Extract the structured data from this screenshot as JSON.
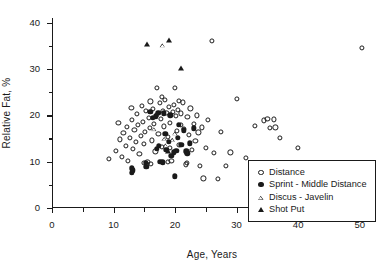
{
  "chart_data": {
    "type": "scatter",
    "title": "",
    "xlabel": "Age, Years",
    "ylabel": "Relative Fat, %",
    "xlim": [
      0,
      52
    ],
    "ylim": [
      0,
      41
    ],
    "xticks": [
      0,
      10,
      20,
      30,
      40,
      50
    ],
    "xtick_labels": [
      "0",
      "10",
      "20",
      "30",
      "40",
      "50"
    ],
    "xminor_ticks": [
      5,
      15,
      25,
      35,
      45
    ],
    "yticks": [
      0,
      10,
      20,
      30,
      40
    ],
    "ytick_labels": [
      "0",
      "10",
      "20",
      "30",
      "40"
    ],
    "yminor_ticks": [
      5,
      15,
      25,
      35
    ],
    "grid": false,
    "legend_position": "lower right",
    "series": [
      {
        "name": "Distance",
        "marker": "open-circle",
        "color": "#1a1a1a",
        "points": [
          [
            9.2,
            10.6
          ],
          [
            10.4,
            12.3
          ],
          [
            11.0,
            14.8
          ],
          [
            11.3,
            11.0
          ],
          [
            11.6,
            16.2
          ],
          [
            12.0,
            13.4
          ],
          [
            12.2,
            17.5
          ],
          [
            12.4,
            10.2
          ],
          [
            12.7,
            15.1
          ],
          [
            13.0,
            19.0
          ],
          [
            13.1,
            12.8
          ],
          [
            13.4,
            16.8
          ],
          [
            13.6,
            14.2
          ],
          [
            13.8,
            20.3
          ],
          [
            14.0,
            17.9
          ],
          [
            14.2,
            11.7
          ],
          [
            14.4,
            15.6
          ],
          [
            14.6,
            22.1
          ],
          [
            14.8,
            18.6
          ],
          [
            15.0,
            13.9
          ],
          [
            15.1,
            16.4
          ],
          [
            15.3,
            20.9
          ],
          [
            15.5,
            10.0
          ],
          [
            15.7,
            19.5
          ],
          [
            15.9,
            17.2
          ],
          [
            16.0,
            23.0
          ],
          [
            16.2,
            14.6
          ],
          [
            16.4,
            21.4
          ],
          [
            16.6,
            18.1
          ],
          [
            16.8,
            12.2
          ],
          [
            17.0,
            26.0
          ],
          [
            17.1,
            20.1
          ],
          [
            17.3,
            16.0
          ],
          [
            17.5,
            22.6
          ],
          [
            17.7,
            19.2
          ],
          [
            17.9,
            13.1
          ],
          [
            18.0,
            21.0
          ],
          [
            18.2,
            17.6
          ],
          [
            18.4,
            23.4
          ],
          [
            18.6,
            20.5
          ],
          [
            18.8,
            15.3
          ],
          [
            19.0,
            21.8
          ],
          [
            19.2,
            18.4
          ],
          [
            19.4,
            10.1
          ],
          [
            19.6,
            20.7
          ],
          [
            19.8,
            22.3
          ],
          [
            20.0,
            26.0
          ],
          [
            20.1,
            19.8
          ],
          [
            20.3,
            16.6
          ],
          [
            20.5,
            21.2
          ],
          [
            20.7,
            13.6
          ],
          [
            20.9,
            18.0
          ],
          [
            21.0,
            20.4
          ],
          [
            21.3,
            22.8
          ],
          [
            21.5,
            17.0
          ],
          [
            21.7,
            9.4
          ],
          [
            22.0,
            19.6
          ],
          [
            22.2,
            15.8
          ],
          [
            22.5,
            21.5
          ],
          [
            22.8,
            12.5
          ],
          [
            23.0,
            18.2
          ],
          [
            23.3,
            14.4
          ],
          [
            23.5,
            20.0
          ],
          [
            23.8,
            16.3
          ],
          [
            24.0,
            9.0
          ],
          [
            24.3,
            17.4
          ],
          [
            24.6,
            6.4
          ],
          [
            25.0,
            13.0
          ],
          [
            25.4,
            19.0
          ],
          [
            26.0,
            36.0
          ],
          [
            26.3,
            11.9
          ],
          [
            27.0,
            6.3
          ],
          [
            27.5,
            16.5
          ],
          [
            28.2,
            9.1
          ],
          [
            29.0,
            12.0
          ],
          [
            30.0,
            23.5
          ],
          [
            31.5,
            10.8
          ],
          [
            33.0,
            17.8
          ],
          [
            34.5,
            18.9
          ],
          [
            35.0,
            19.2
          ],
          [
            35.4,
            17.2
          ],
          [
            36.0,
            19.1
          ],
          [
            36.3,
            17.4
          ],
          [
            37.0,
            15.2
          ],
          [
            40.0,
            13.0
          ],
          [
            50.3,
            34.5
          ],
          [
            10.8,
            18.3
          ],
          [
            12.9,
            21.6
          ],
          [
            16.1,
            9.6
          ],
          [
            17.8,
            24.0
          ],
          [
            19.1,
            12.9
          ],
          [
            20.6,
            23.1
          ],
          [
            21.9,
            9.8
          ],
          [
            14.9,
            9.8
          ],
          [
            18.9,
            9.9
          ],
          [
            15.4,
            9.5
          ]
        ]
      },
      {
        "name": "Sprint - Middle Distance",
        "marker": "filled-circle",
        "color": "#1a1a1a",
        "points": [
          [
            13.0,
            8.6
          ],
          [
            13.0,
            7.6
          ],
          [
            13.1,
            8.1
          ],
          [
            15.2,
            9.8
          ],
          [
            15.3,
            8.9
          ],
          [
            16.9,
            19.8
          ],
          [
            17.3,
            20.6
          ],
          [
            17.4,
            13.4
          ],
          [
            17.6,
            10.0
          ],
          [
            18.0,
            9.9
          ],
          [
            18.2,
            20.4
          ],
          [
            18.4,
            16.0
          ],
          [
            18.6,
            12.6
          ],
          [
            19.0,
            14.3
          ],
          [
            19.2,
            20.0
          ],
          [
            19.4,
            11.2
          ],
          [
            20.0,
            6.8
          ],
          [
            20.2,
            12.4
          ],
          [
            20.4,
            15.1
          ],
          [
            20.6,
            18.0
          ],
          [
            21.0,
            13.7
          ],
          [
            21.4,
            16.8
          ],
          [
            22.0,
            11.8
          ],
          [
            22.4,
            14.0
          ],
          [
            23.0,
            17.2
          ],
          [
            16.0,
            20.8
          ],
          [
            16.4,
            19.4
          ],
          [
            19.8,
            12.0
          ],
          [
            17.0,
            12.8
          ],
          [
            21.8,
            12.2
          ]
        ]
      },
      {
        "name": "Discus - Javelin",
        "marker": "open-triangle",
        "color": "#1a1a1a",
        "points": [
          [
            18.0,
            35.2
          ],
          [
            16.6,
            17.1
          ],
          [
            18.3,
            15.0
          ],
          [
            18.5,
            13.6
          ],
          [
            19.6,
            14.8
          ],
          [
            20.0,
            16.2
          ]
        ]
      },
      {
        "name": "Shot Put",
        "marker": "filled-triangle",
        "color": "#1a1a1a",
        "points": [
          [
            15.5,
            35.3
          ],
          [
            19.0,
            36.2
          ],
          [
            21.0,
            30.2
          ],
          [
            18.8,
            12.2
          ]
        ]
      }
    ]
  },
  "legend": {
    "entries": [
      {
        "label": "Distance",
        "marker": "open-circle"
      },
      {
        "label": "Sprint - Middle Distance",
        "marker": "filled-circle"
      },
      {
        "label": "Discus - Javelin",
        "marker": "open-triangle"
      },
      {
        "label": "Shot Put",
        "marker": "filled-triangle"
      }
    ]
  }
}
